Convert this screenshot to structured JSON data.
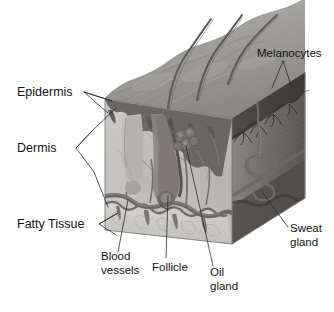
{
  "diagram": {
    "background_color": "#ffffff",
    "text_color": "#111111",
    "leader_color": "#2b2b2b",
    "palette": {
      "epidermis_surface": "#9a9a9a",
      "epidermis_band": "#6e6a68",
      "dermis_fill": "#bdbdbd",
      "dermis_front": "#b4b4b4",
      "side_face_dark": "#4a4745",
      "fatty_tissue": "#cfcdc9",
      "hair_shaft": "#5d5a58",
      "vessel": "#6b6664",
      "gland": "#787371"
    },
    "labels": [
      {
        "id": "epidermis",
        "text": "Epidermis",
        "lines": [
          "Epidermis"
        ],
        "x": 17,
        "y": 96
      },
      {
        "id": "dermis",
        "text": "Dermis",
        "lines": [
          "Dermis"
        ],
        "x": 17,
        "y": 152
      },
      {
        "id": "fatty-tissue",
        "text": "Fatty Tissue",
        "lines": [
          "Fatty Tissue"
        ],
        "x": 17,
        "y": 228
      },
      {
        "id": "melanocytes",
        "text": "Melanocytes",
        "lines": [
          "Melanocytes"
        ],
        "x": 257,
        "y": 57
      },
      {
        "id": "sweat-gland",
        "text": "Sweat gland",
        "lines": [
          "Sweat",
          "gland"
        ],
        "x": 290,
        "y": 232
      },
      {
        "id": "blood-vessels",
        "text": "Blood vessels",
        "lines": [
          "Blood",
          "vessels"
        ],
        "x": 101,
        "y": 260
      },
      {
        "id": "follicle",
        "text": "Follicle",
        "lines": [
          "Follicle"
        ],
        "x": 152,
        "y": 271
      },
      {
        "id": "oil-gland",
        "text": "Oil gland",
        "lines": [
          "Oil",
          "gland"
        ],
        "x": 210,
        "y": 276
      }
    ],
    "structures": [
      {
        "id": "hair-shaft-1",
        "name": "hair shaft"
      },
      {
        "id": "hair-shaft-2",
        "name": "hair shaft"
      },
      {
        "id": "hair-shaft-3",
        "name": "hair shaft"
      },
      {
        "id": "follicle-body",
        "name": "hair follicle"
      },
      {
        "id": "oil-gland-body",
        "name": "sebaceous (oil) gland"
      },
      {
        "id": "sweat-coil",
        "name": "coiled sweat gland"
      },
      {
        "id": "sweat-duct",
        "name": "sweat duct"
      },
      {
        "id": "vessel-network",
        "name": "blood vessel network"
      },
      {
        "id": "melanocyte-layer",
        "name": "melanocyte layer"
      }
    ]
  }
}
